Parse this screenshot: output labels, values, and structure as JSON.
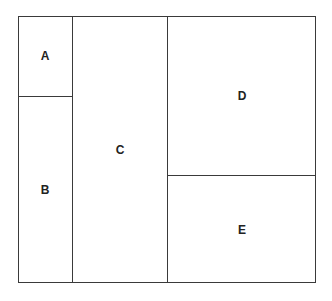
{
  "diagram": {
    "type": "treemap-partition",
    "regions": [
      {
        "id": "A",
        "label": "A"
      },
      {
        "id": "B",
        "label": "B"
      },
      {
        "id": "C",
        "label": "C"
      },
      {
        "id": "D",
        "label": "D"
      },
      {
        "id": "E",
        "label": "E"
      }
    ]
  }
}
